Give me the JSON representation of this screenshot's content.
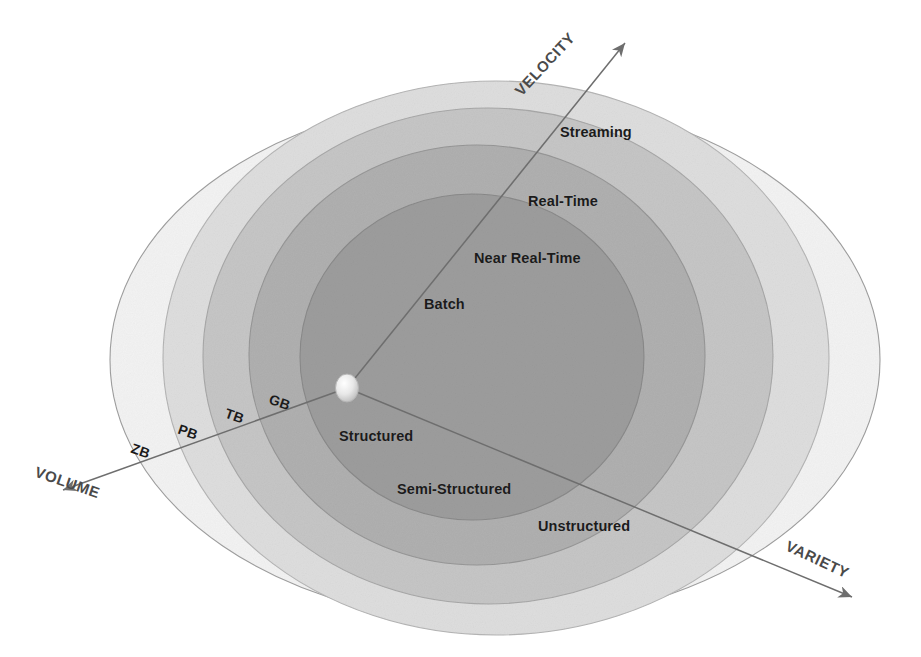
{
  "diagram": {
    "type": "concentric-ellipse-venn",
    "background": "#ffffff",
    "center_origin": {
      "x": 347,
      "y": 388,
      "marker": "origin-bubble"
    }
  },
  "axes": [
    {
      "id": "velocity",
      "label": "VELOCITY",
      "direction": "up-right",
      "rotation_deg": -47,
      "label_pos": {
        "x": 512,
        "y": 88
      },
      "line": {
        "x1": 347,
        "y1": 388,
        "x2": 625,
        "y2": 43
      },
      "arrow": "arrowhead-end",
      "color": "#6e6e6e"
    },
    {
      "id": "volume",
      "label": "VOLUME",
      "direction": "down-left",
      "rotation_deg": 19,
      "label_pos": {
        "x": 38,
        "y": 464
      },
      "line": {
        "x1": 347,
        "y1": 388,
        "x2": 63,
        "y2": 490
      },
      "arrow": "arrowhead-end",
      "color": "#6e6e6e"
    },
    {
      "id": "variety",
      "label": "VARIETY",
      "direction": "down-right",
      "rotation_deg": 25,
      "label_pos": {
        "x": 790,
        "y": 538
      },
      "line": {
        "x1": 347,
        "y1": 388,
        "x2": 852,
        "y2": 597
      },
      "arrow": "arrowhead-end",
      "color": "#6e6e6e"
    }
  ],
  "rings": [
    {
      "index": 0,
      "name": "innermost",
      "fill": "#9d9d9d",
      "stroke": "#8a8a8a",
      "cx": 472,
      "cy": 357,
      "rx": 172,
      "ry": 163
    },
    {
      "index": 1,
      "name": "second",
      "fill": "#b0b0b0",
      "stroke": "#979797",
      "cx": 477,
      "cy": 355,
      "rx": 228,
      "ry": 210
    },
    {
      "index": 2,
      "name": "third",
      "fill": "#c6c6c6",
      "stroke": "#a8a8a8",
      "cx": 488,
      "cy": 356,
      "rx": 285,
      "ry": 248
    },
    {
      "index": 3,
      "name": "fourth",
      "fill": "#dedede",
      "stroke": "#b5b5b5",
      "cx": 496,
      "cy": 358,
      "rx": 333,
      "ry": 277
    },
    {
      "index": 4,
      "name": "outermost",
      "fill": "#f3f3f3",
      "stroke": "#9f9f9f",
      "cx": 495,
      "cy": 360,
      "rx": 385,
      "ry": 263
    }
  ],
  "velocity_labels": [
    {
      "text": "Streaming",
      "x": 560,
      "y": 125,
      "ring": 4
    },
    {
      "text": "Real-Time",
      "x": 528,
      "y": 194,
      "ring": 3
    },
    {
      "text": "Near Real-Time",
      "x": 474,
      "y": 251,
      "ring": 2
    },
    {
      "text": "Batch",
      "x": 424,
      "y": 297,
      "ring": 1
    }
  ],
  "variety_labels": [
    {
      "text": "Structured",
      "x": 339,
      "y": 429,
      "ring": 1
    },
    {
      "text": "Semi-Structured",
      "x": 397,
      "y": 482,
      "ring": 2
    },
    {
      "text": "Unstructured",
      "x": 538,
      "y": 519,
      "ring": 3
    }
  ],
  "volume_labels": [
    {
      "text": "GB",
      "x": 272,
      "y": 392,
      "rotation_deg": 19,
      "ring": 1
    },
    {
      "text": "TB",
      "x": 228,
      "y": 406,
      "rotation_deg": 19,
      "ring": 2
    },
    {
      "text": "PB",
      "x": 181,
      "y": 422,
      "rotation_deg": 19,
      "ring": 3
    },
    {
      "text": "ZB",
      "x": 134,
      "y": 441,
      "rotation_deg": 19,
      "ring": 4
    }
  ],
  "chart_data": {
    "type": "diagram",
    "dimensions": [
      {
        "axis": "VELOCITY",
        "direction": "increasing outward (up-right)",
        "levels": [
          "Batch",
          "Near Real-Time",
          "Real-Time",
          "Streaming"
        ]
      },
      {
        "axis": "VARIETY",
        "direction": "increasing outward (down-right)",
        "levels": [
          "Structured",
          "Semi-Structured",
          "Unstructured"
        ]
      },
      {
        "axis": "VOLUME",
        "direction": "increasing outward (down-left)",
        "levels": [
          "GB",
          "TB",
          "PB",
          "ZB"
        ]
      }
    ],
    "ring_count": 5,
    "legend_position": "none",
    "grid": false
  }
}
